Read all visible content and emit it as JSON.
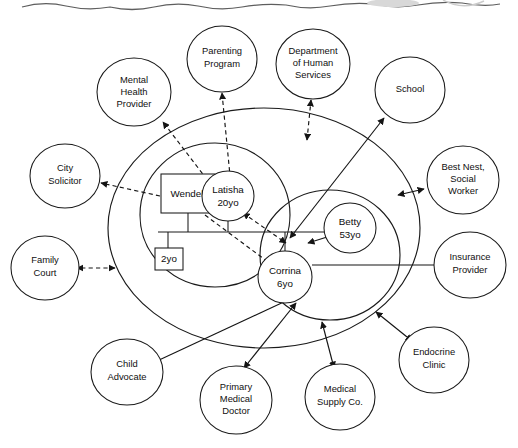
{
  "diagram": {
    "type": "ecomap-genogram",
    "colors": {
      "ink": "#1a1a1a",
      "background": "#ffffff",
      "scan_artifact": "#5e5e5e"
    }
  },
  "family_system": {
    "household_label": "household",
    "members": [
      {
        "id": "wendell",
        "name": "Wendell",
        "age_label": "",
        "shape": "square"
      },
      {
        "id": "latisha",
        "name": "Latisha",
        "age_label": "20yo",
        "shape": "circle"
      },
      {
        "id": "toddler",
        "name": "2yo",
        "age_label": "",
        "shape": "square"
      },
      {
        "id": "corrina",
        "name": "Corrina",
        "age_label": "6yo",
        "shape": "circle"
      },
      {
        "id": "betty",
        "name": "Betty",
        "age_label": "53yo",
        "shape": "circle"
      }
    ]
  },
  "external_systems": [
    {
      "id": "mental-health-provider",
      "lines": [
        "Mental",
        "Health",
        "Provider"
      ],
      "connection": "dashed-bidirectional"
    },
    {
      "id": "parenting-program",
      "lines": [
        "Parenting",
        "Program"
      ],
      "connection": "dashed-bidirectional"
    },
    {
      "id": "department-of-human-services",
      "lines": [
        "Department",
        "of Human",
        "Services"
      ],
      "connection": "dashed-bidirectional"
    },
    {
      "id": "school",
      "lines": [
        "School"
      ],
      "connection": "solid-bidirectional"
    },
    {
      "id": "best-nest-social-worker",
      "lines": [
        "Best Nest,",
        "Social",
        "Worker"
      ],
      "connection": "solid-bidirectional"
    },
    {
      "id": "insurance-provider",
      "lines": [
        "Insurance",
        "Provider"
      ],
      "connection": "plain-line"
    },
    {
      "id": "endocrine-clinic",
      "lines": [
        "Endocrine",
        "Clinic"
      ],
      "connection": "solid-bidirectional"
    },
    {
      "id": "medical-supply-co",
      "lines": [
        "Medical",
        "Supply Co."
      ],
      "connection": "solid-bidirectional"
    },
    {
      "id": "primary-medical-doctor",
      "lines": [
        "Primary",
        "Medical",
        "Doctor"
      ],
      "connection": "solid-bidirectional"
    },
    {
      "id": "child-advocate",
      "lines": [
        "Child",
        "Advocate"
      ],
      "connection": "plain-line"
    },
    {
      "id": "family-court",
      "lines": [
        "Family",
        "Court"
      ],
      "connection": "dashed-bidirectional"
    },
    {
      "id": "city-solicitor",
      "lines": [
        "City",
        "Solicitor"
      ],
      "connection": "dashed-unidirectional"
    }
  ],
  "labels": {
    "mental_health_provider_l1": "Mental",
    "mental_health_provider_l2": "Health",
    "mental_health_provider_l3": "Provider",
    "parenting_program_l1": "Parenting",
    "parenting_program_l2": "Program",
    "dhs_l1": "Department",
    "dhs_l2": "of Human",
    "dhs_l3": "Services",
    "school_l1": "School",
    "best_nest_l1": "Best Nest,",
    "best_nest_l2": "Social",
    "best_nest_l3": "Worker",
    "insurance_l1": "Insurance",
    "insurance_l2": "Provider",
    "endocrine_l1": "Endocrine",
    "endocrine_l2": "Clinic",
    "medsupply_l1": "Medical",
    "medsupply_l2": "Supply Co.",
    "pmd_l1": "Primary",
    "pmd_l2": "Medical",
    "pmd_l3": "Doctor",
    "child_advocate_l1": "Child",
    "child_advocate_l2": "Advocate",
    "family_court_l1": "Family",
    "family_court_l2": "Court",
    "city_solicitor_l1": "City",
    "city_solicitor_l2": "Solicitor",
    "wendell": "Wendell",
    "latisha_l1": "Latisha",
    "latisha_l2": "20yo",
    "toddler": "2yo",
    "corrina_l1": "Corrina",
    "corrina_l2": "6yo",
    "betty_l1": "Betty",
    "betty_l2": "53yo"
  }
}
